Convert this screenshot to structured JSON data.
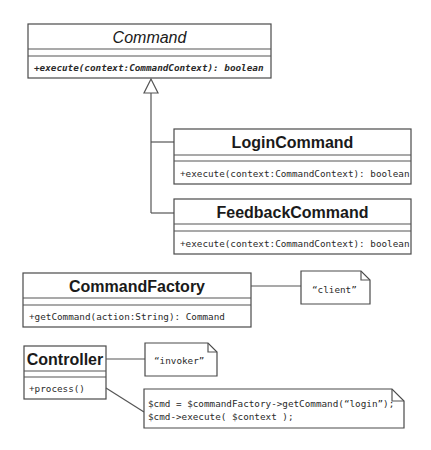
{
  "diagram": {
    "type": "uml-class-diagram",
    "classes": [
      {
        "id": "command",
        "name": "Command",
        "abstract": true,
        "attributes": [],
        "operations": [
          "+execute(context:CommandContext): boolean"
        ]
      },
      {
        "id": "login_command",
        "name": "LoginCommand",
        "abstract": false,
        "attributes": [],
        "operations": [
          "+execute(context:CommandContext): boolean"
        ]
      },
      {
        "id": "feedback_command",
        "name": "FeedbackCommand",
        "abstract": false,
        "attributes": [],
        "operations": [
          "+execute(context:CommandContext): boolean"
        ]
      },
      {
        "id": "command_factory",
        "name": "CommandFactory",
        "abstract": false,
        "attributes": [],
        "operations": [
          "+getCommand(action:String): Command"
        ]
      },
      {
        "id": "controller",
        "name": "Controller",
        "abstract": false,
        "attributes": [],
        "operations": [
          "+process()"
        ]
      }
    ],
    "notes": [
      {
        "id": "client_note",
        "text": "“client”",
        "attached_to": "command_factory"
      },
      {
        "id": "invoker_note",
        "text": "“invoker”",
        "attached_to": "controller"
      },
      {
        "id": "code_note",
        "lines": [
          "$cmd = $commandFactory->getCommand(“login”);",
          "$cmd->execute( $context );"
        ],
        "attached_to": "controller"
      }
    ],
    "relationships": [
      {
        "type": "generalization",
        "from": "login_command",
        "to": "command"
      },
      {
        "type": "generalization",
        "from": "feedback_command",
        "to": "command"
      }
    ]
  }
}
